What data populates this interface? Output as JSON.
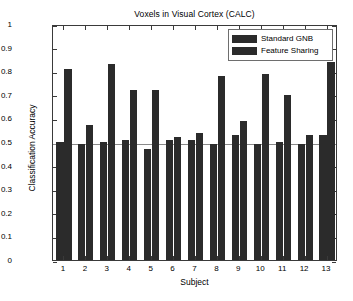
{
  "chart_data": {
    "type": "bar",
    "title": "Voxels in Visual Cortex (CALC)",
    "xlabel": "Subject",
    "ylabel": "Classification Accuracy",
    "categories": [
      "1",
      "2",
      "3",
      "4",
      "5",
      "6",
      "7",
      "8",
      "9",
      "10",
      "11",
      "12",
      "13"
    ],
    "series": [
      {
        "name": "Standard GNB",
        "color": "#2b2b2b",
        "values": [
          0.5,
          0.49,
          0.5,
          0.51,
          0.47,
          0.51,
          0.51,
          0.49,
          0.53,
          0.49,
          0.5,
          0.49,
          0.53
        ]
      },
      {
        "name": "Feature Sharing",
        "color": "#2b2b2b",
        "values": [
          0.81,
          0.57,
          0.83,
          0.72,
          0.72,
          0.52,
          0.54,
          0.78,
          0.59,
          0.79,
          0.7,
          0.53,
          0.84
        ]
      }
    ],
    "ylim": [
      0,
      1
    ],
    "yticks": [
      0,
      0.1,
      0.2,
      0.3,
      0.4,
      0.5,
      0.6,
      0.7,
      0.8,
      0.9,
      1
    ],
    "ytick_labels": [
      "0",
      "0.1",
      "0.2",
      "0.3",
      "0.4",
      "0.5",
      "0.6",
      "0.7",
      "0.8",
      "0.9",
      "1"
    ],
    "grid": false,
    "chance_line": 0.5,
    "legend_position": "top-right",
    "legend_entries": [
      "Standard GNB",
      "Feature Sharing"
    ]
  },
  "figure": {
    "background": "#ffffff",
    "axis_color": "#3a3a3a",
    "gridline_color": "#8a8a8a"
  }
}
